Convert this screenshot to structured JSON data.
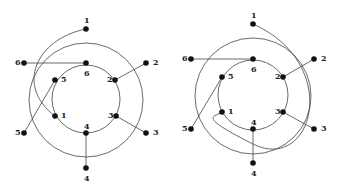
{
  "figure": {
    "diagrams": [
      {
        "id": "left",
        "outer_ring": {
          "cx": 86,
          "cy": 100,
          "r": 57
        },
        "inner_ring": {
          "cx": 86,
          "cy": 99,
          "r": 34
        },
        "outer_nodes": [
          {
            "label": "1",
            "x": 86,
            "y": 29,
            "lx": 84,
            "ly": 23
          },
          {
            "label": "2",
            "x": 146,
            "y": 63,
            "lx": 153,
            "ly": 65
          },
          {
            "label": "3",
            "x": 146,
            "y": 133,
            "lx": 153,
            "ly": 135
          },
          {
            "label": "4",
            "x": 86,
            "y": 168,
            "lx": 84,
            "ly": 181
          },
          {
            "label": "5",
            "x": 24,
            "y": 133,
            "lx": 15,
            "ly": 135
          },
          {
            "label": "6",
            "x": 24,
            "y": 63,
            "lx": 15,
            "ly": 65
          }
        ],
        "inner_nodes": [
          {
            "label": "6",
            "x": 86,
            "y": 63,
            "lx": 84,
            "ly": 76
          },
          {
            "label": "2",
            "x": 115,
            "y": 80,
            "lx": 107,
            "ly": 82
          },
          {
            "label": "3",
            "x": 116,
            "y": 116,
            "lx": 108,
            "ly": 118
          },
          {
            "label": "4",
            "x": 86,
            "y": 133,
            "lx": 84,
            "ly": 129
          },
          {
            "label": "1",
            "x": 55,
            "y": 116,
            "lx": 61,
            "ly": 118
          },
          {
            "label": "5",
            "x": 55,
            "y": 80,
            "lx": 61,
            "ly": 82
          }
        ],
        "edges": [
          {
            "type": "line",
            "from": "outer-6",
            "to": "inner-6"
          },
          {
            "type": "line",
            "from": "outer-2",
            "to": "inner-2"
          },
          {
            "type": "line",
            "from": "outer-5",
            "to": "inner-5"
          },
          {
            "type": "line",
            "from": "outer-4",
            "to": "inner-4"
          },
          {
            "type": "line",
            "from": "outer-3",
            "to": "inner-3"
          },
          {
            "type": "arc",
            "from": "outer-1",
            "to": "inner-1"
          }
        ]
      },
      {
        "id": "right",
        "outer_ring": {
          "cx": 253,
          "cy": 96,
          "r": 58
        },
        "inner_ring": {
          "cx": 253,
          "cy": 95,
          "r": 35
        },
        "outer_nodes": [
          {
            "label": "1",
            "x": 253,
            "y": 24,
            "lx": 251,
            "ly": 18
          },
          {
            "label": "2",
            "x": 314,
            "y": 59,
            "lx": 321,
            "ly": 61
          },
          {
            "label": "3",
            "x": 314,
            "y": 129,
            "lx": 321,
            "ly": 131
          },
          {
            "label": "4",
            "x": 253,
            "y": 163,
            "lx": 251,
            "ly": 176
          },
          {
            "label": "5",
            "x": 191,
            "y": 129,
            "lx": 182,
            "ly": 131
          },
          {
            "label": "6",
            "x": 191,
            "y": 59,
            "lx": 182,
            "ly": 61
          }
        ],
        "inner_nodes": [
          {
            "label": "6",
            "x": 253,
            "y": 59,
            "lx": 251,
            "ly": 72
          },
          {
            "label": "2",
            "x": 283,
            "y": 77,
            "lx": 275,
            "ly": 79
          },
          {
            "label": "3",
            "x": 283,
            "y": 112,
            "lx": 275,
            "ly": 114
          },
          {
            "label": "4",
            "x": 253,
            "y": 129,
            "lx": 251,
            "ly": 125
          },
          {
            "label": "1",
            "x": 222,
            "y": 112,
            "lx": 228,
            "ly": 114
          },
          {
            "label": "5",
            "x": 222,
            "y": 77,
            "lx": 228,
            "ly": 79
          }
        ],
        "edges": [
          {
            "type": "line",
            "from": "outer-6",
            "to": "inner-6"
          },
          {
            "type": "line",
            "from": "outer-2",
            "to": "inner-2"
          },
          {
            "type": "line",
            "from": "outer-5",
            "to": "inner-5"
          },
          {
            "type": "line",
            "from": "outer-4",
            "to": "inner-4"
          },
          {
            "type": "line",
            "from": "outer-3",
            "to": "inner-3"
          },
          {
            "type": "arc",
            "from": "outer-1",
            "to": "inner-1"
          }
        ]
      }
    ]
  }
}
